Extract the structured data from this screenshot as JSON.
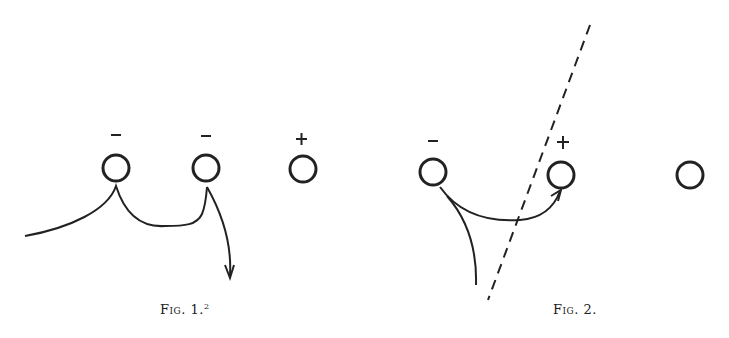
{
  "figures": [
    {
      "caption": "Fig. 1.",
      "caption_sup": "2",
      "atoms": [
        {
          "charge": "−",
          "cx": 116,
          "cy": 168
        },
        {
          "charge": "−",
          "cx": 206,
          "cy": 168
        },
        {
          "charge": "+",
          "cx": 303,
          "cy": 168
        }
      ]
    },
    {
      "caption": "Fig. 2.",
      "atoms": [
        {
          "charge": "−",
          "cx": 433,
          "cy": 172
        },
        {
          "charge": "+",
          "cx": 561,
          "cy": 175
        },
        {
          "charge": "",
          "cx": 690,
          "cy": 175
        }
      ]
    }
  ],
  "colors": {
    "ink": "#222222",
    "background": "#ffffff"
  }
}
